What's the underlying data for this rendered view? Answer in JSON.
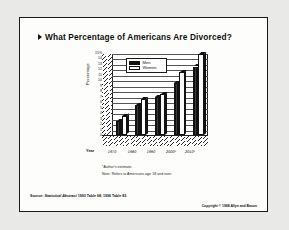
{
  "slide": {
    "bullet_icon": "triangle-right-icon",
    "title": "What Percentage of Americans Are Divorced?",
    "notes": [
      "*Author's estimate.",
      "Note: Refers to Americans age 18 and over."
    ],
    "source_prefix": "Source: ",
    "source_italic": "Statistical Abstract",
    "source_rest": " 1993 Table 68; 1996 Table 83.",
    "copyright": "Copyright © 1998 Allyn and Bacon"
  },
  "chart_data": {
    "type": "bar",
    "title": "",
    "xlabel": "Year",
    "ylabel": "Percentage",
    "categories": [
      "1970",
      "1980",
      "1990",
      "2000*",
      "2010*"
    ],
    "series": [
      {
        "name": "Men",
        "values": [
          2.5,
          5.5,
          7.0,
          9.5,
          12.5
        ]
      },
      {
        "name": "Women",
        "values": [
          3.5,
          6.5,
          7.5,
          11.5,
          14.8
        ]
      }
    ],
    "ylim": [
      0,
      15
    ],
    "ytick_labels": [
      "15%",
      "14",
      "13",
      "12",
      "11",
      "10",
      "9",
      "8",
      "7",
      "6",
      "5",
      "4",
      "3",
      "2",
      "1",
      "0"
    ],
    "ytick_values": [
      15,
      14,
      13,
      12,
      11,
      10,
      9,
      8,
      7,
      6,
      5,
      4,
      3,
      2,
      1,
      0
    ],
    "grid": true,
    "legend_position": "top-left",
    "style_3d": true
  }
}
